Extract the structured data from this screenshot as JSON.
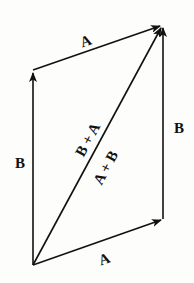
{
  "diagram": {
    "colors": {
      "stroke": "#111111",
      "background": "#fdfdfb"
    },
    "vectors": [
      {
        "name": "A (bottom)",
        "label": "A",
        "from": [
          33,
          265
        ],
        "to": [
          163,
          219
        ]
      },
      {
        "name": "B (right)",
        "label": "B",
        "from": [
          163,
          219
        ],
        "to": [
          163,
          25
        ]
      },
      {
        "name": "B (left)",
        "label": "B",
        "from": [
          33,
          265
        ],
        "to": [
          33,
          70
        ]
      },
      {
        "name": "A (top)",
        "label": "A",
        "from": [
          33,
          70
        ],
        "to": [
          163,
          25
        ]
      },
      {
        "name": "Resultant",
        "label": "A + B",
        "from": [
          33,
          265
        ],
        "to": [
          163,
          25
        ]
      }
    ],
    "labels": {
      "a_top": "A",
      "a_bottom": "A",
      "b_left": "B",
      "b_right": "B",
      "diag_upper": "B + A",
      "diag_lower": "A + B"
    }
  }
}
